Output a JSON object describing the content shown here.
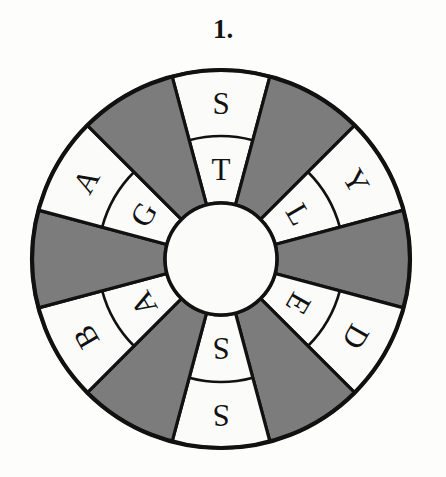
{
  "puzzle": {
    "number_label": "1.",
    "type": "letter-wheel",
    "sector_count": 12,
    "ring_count": 2,
    "geometry": {
      "center_x": 221,
      "center_y": 259,
      "outer_radius": 189,
      "ring_divider_radius": 123,
      "hub_radius": 56,
      "sector_span_degrees": 30,
      "first_sector_start_degrees": -105
    },
    "colors": {
      "shaded_sector": "#7c7c7c",
      "unshaded_sector": "#fbfbf9",
      "outline": "#111111",
      "hub": "#fbfbf9",
      "letter": "#111111",
      "background": "#fdfdfb"
    },
    "sectors": [
      {
        "index": 0,
        "position": "top",
        "center_degrees": -90,
        "shaded": false,
        "outer_letter": "S",
        "inner_letter": "T"
      },
      {
        "index": 1,
        "position": "top-right-1",
        "center_degrees": -60,
        "shaded": true,
        "outer_letter": "",
        "inner_letter": ""
      },
      {
        "index": 2,
        "position": "top-right-2",
        "center_degrees": -30,
        "shaded": false,
        "outer_letter": "Y",
        "inner_letter": "L"
      },
      {
        "index": 3,
        "position": "right",
        "center_degrees": 0,
        "shaded": true,
        "outer_letter": "",
        "inner_letter": ""
      },
      {
        "index": 4,
        "position": "bottom-right-1",
        "center_degrees": 30,
        "shaded": false,
        "outer_letter": "D",
        "inner_letter": "E"
      },
      {
        "index": 5,
        "position": "bottom-right-2",
        "center_degrees": 60,
        "shaded": true,
        "outer_letter": "",
        "inner_letter": ""
      },
      {
        "index": 6,
        "position": "bottom",
        "center_degrees": 90,
        "shaded": false,
        "outer_letter": "S",
        "inner_letter": "S"
      },
      {
        "index": 7,
        "position": "bottom-left-1",
        "center_degrees": 120,
        "shaded": true,
        "outer_letter": "",
        "inner_letter": ""
      },
      {
        "index": 8,
        "position": "bottom-left-2",
        "center_degrees": 150,
        "shaded": false,
        "outer_letter": "B",
        "inner_letter": "A"
      },
      {
        "index": 9,
        "position": "left",
        "center_degrees": 180,
        "shaded": true,
        "outer_letter": "",
        "inner_letter": ""
      },
      {
        "index": 10,
        "position": "top-left-1",
        "center_degrees": 210,
        "shaded": false,
        "outer_letter": "A",
        "inner_letter": "G"
      },
      {
        "index": 11,
        "position": "top-left-2",
        "center_degrees": 240,
        "shaded": true,
        "outer_letter": "",
        "inner_letter": ""
      }
    ],
    "letters_clockwise_from_top": {
      "outer_ring": [
        "S",
        "",
        "Y",
        "",
        "D",
        "",
        "S",
        "",
        "B",
        "",
        "A",
        ""
      ],
      "inner_ring": [
        "T",
        "",
        "L",
        "",
        "E",
        "",
        "S",
        "",
        "A",
        "",
        "G",
        ""
      ]
    }
  }
}
